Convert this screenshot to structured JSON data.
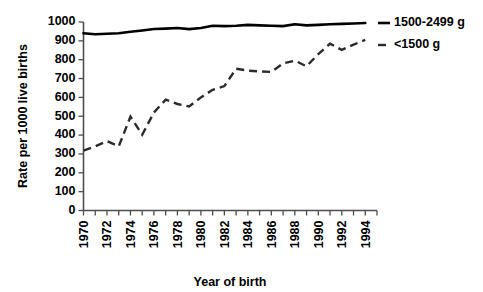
{
  "chart_data": {
    "type": "line",
    "title": "",
    "subtitle": "",
    "xlabel": "Year of birth",
    "ylabel": "Rate per 1000 live births",
    "xlim": [
      1970,
      1995
    ],
    "ylim": [
      0,
      1000
    ],
    "grid": false,
    "legend_position": "right",
    "x": [
      1970,
      1971,
      1972,
      1973,
      1974,
      1975,
      1976,
      1977,
      1978,
      1979,
      1980,
      1981,
      1982,
      1983,
      1984,
      1985,
      1986,
      1987,
      1988,
      1989,
      1990,
      1991,
      1992,
      1993,
      1994
    ],
    "xtick_labels": [
      "1970",
      "1972",
      "1974",
      "1976",
      "1978",
      "1980",
      "1982",
      "1984",
      "1986",
      "1988",
      "1990",
      "1992",
      "1994"
    ],
    "xtick_values": [
      1970,
      1972,
      1974,
      1976,
      1978,
      1980,
      1982,
      1984,
      1986,
      1988,
      1990,
      1992,
      1994
    ],
    "xtick_minor_values": [
      1971,
      1973,
      1975,
      1977,
      1979,
      1981,
      1983,
      1985,
      1987,
      1989,
      1991,
      1993,
      1995
    ],
    "ytick_labels": [
      "0",
      "100",
      "200",
      "300",
      "400",
      "500",
      "600",
      "700",
      "800",
      "900",
      "1000"
    ],
    "ytick_values": [
      0,
      100,
      200,
      300,
      400,
      500,
      600,
      700,
      800,
      900,
      1000
    ],
    "series": [
      {
        "name": "1500-2499 g",
        "style": "solid",
        "color": "#000000",
        "values": [
          940,
          935,
          938,
          940,
          948,
          955,
          963,
          965,
          968,
          962,
          968,
          980,
          978,
          980,
          985,
          982,
          980,
          978,
          988,
          982,
          985,
          988,
          990,
          992,
          995
        ]
      },
      {
        "name": "<1500 g",
        "style": "dashed",
        "color": "#2b2b2b",
        "values": [
          318,
          340,
          368,
          340,
          498,
          402,
          520,
          588,
          565,
          552,
          600,
          640,
          660,
          752,
          742,
          738,
          735,
          780,
          795,
          765,
          830,
          885,
          852,
          880,
          905
        ]
      }
    ],
    "legend": [
      {
        "label": "1500-2499 g",
        "style": "solid",
        "color": "#000000"
      },
      {
        "label": "<1500 g",
        "style": "dashed",
        "color": "#2b2b2b"
      }
    ]
  },
  "axes": {
    "ylabel": "Rate per 1000 live births",
    "xlabel": "Year of birth"
  },
  "legend": {
    "item0": "1500-2499 g",
    "item1": "<1500 g"
  }
}
